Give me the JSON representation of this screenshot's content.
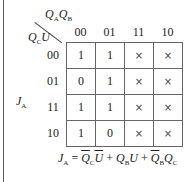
{
  "kmap": {
    "output_label": "J",
    "output_sub": "A",
    "col_var1": "Q",
    "col_var1_sub": "A",
    "col_var2": "Q",
    "col_var2_sub": "B",
    "row_var1": "Q",
    "row_var1_sub": "C",
    "row_var2": "U",
    "columns": [
      "00",
      "01",
      "11",
      "10"
    ],
    "rows": [
      {
        "label": "00",
        "cells": [
          "1",
          "1",
          "×",
          "×"
        ]
      },
      {
        "label": "01",
        "cells": [
          "0",
          "1",
          "×",
          "×"
        ]
      },
      {
        "label": "11",
        "cells": [
          "1",
          "1",
          "×",
          "×"
        ]
      },
      {
        "label": "10",
        "cells": [
          "1",
          "0",
          "×",
          "×"
        ]
      }
    ]
  },
  "equation": {
    "lhs": "J",
    "lhs_sub": "A",
    "equals": " = ",
    "t1a": "Q",
    "t1a_sub": "C",
    "t1b": "U",
    "plus1": " + ",
    "t2a": "Q",
    "t2a_sub": "B",
    "t2b": "U",
    "plus2": " + ",
    "t3a": "Q",
    "t3a_sub": "B",
    "t3b": "Q",
    "t3b_sub": "C"
  }
}
